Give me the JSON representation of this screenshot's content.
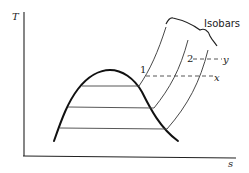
{
  "diagram": {
    "type": "T-s diagram (saturation dome with isobars)",
    "axes": {
      "y_label": "T",
      "x_label": "s"
    },
    "labels": {
      "isobars": "Isobars",
      "point_1": "1",
      "point_2": "2",
      "point_x": "x",
      "point_y": "y"
    },
    "elements": {
      "saturation_dome": "bell-shaped saturation curve",
      "tie_lines": 3,
      "isobar_count": 3,
      "dashed_lines": [
        {
          "from": "1",
          "to": "x"
        },
        {
          "from": "2",
          "to": "y"
        }
      ]
    }
  }
}
